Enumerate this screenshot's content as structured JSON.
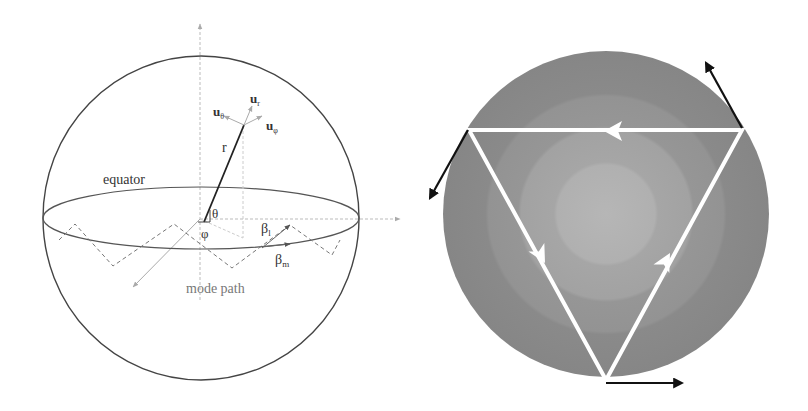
{
  "left_figure": {
    "description": "Sphere with spherical coordinate system and mode path",
    "labels": {
      "u_theta": "u",
      "u_theta_sub": "θ",
      "u_r": "u",
      "u_r_sub": "r",
      "u_phi": "u",
      "u_phi_sub": "φ",
      "r": "r",
      "equator": "equator",
      "theta": "θ",
      "phi": "φ",
      "beta_l": "β",
      "beta_l_sub": "l",
      "beta_m": "β",
      "beta_m_sub": "m",
      "mode_path": "mode path"
    }
  },
  "right_figure": {
    "description": "Concentric shaded disk with inscribed inverted triangle ray path and tangential arrows",
    "colors": {
      "outer_ring": "#8a8a8a",
      "middle_ring": "#999999",
      "inner_ring": "#a8a8a8",
      "core": "#b4b4b4",
      "ray_path": "#ffffff",
      "arrows": "#111111"
    }
  }
}
